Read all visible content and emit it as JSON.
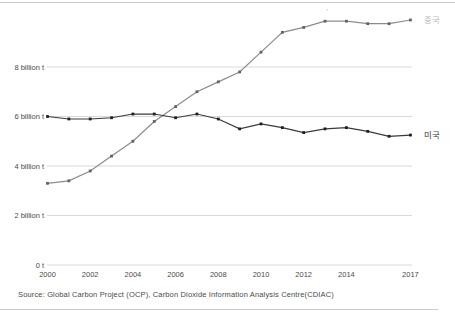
{
  "footer": {
    "source": "Source: Global Carbon Project (OCP), Carbon Dioxide Information Analysis Centre(CDIAC)"
  },
  "chart_data": {
    "type": "line",
    "x": [
      2000,
      2001,
      2002,
      2003,
      2004,
      2005,
      2006,
      2007,
      2008,
      2009,
      2010,
      2011,
      2012,
      2013,
      2014,
      2015,
      2016,
      2017
    ],
    "x_tick_labels": [
      "2000",
      "2002",
      "2004",
      "2006",
      "2008",
      "2010",
      "2012",
      "2014",
      "2017"
    ],
    "x_tick_years": [
      2000,
      2002,
      2004,
      2006,
      2008,
      2010,
      2012,
      2014,
      2017
    ],
    "y_ticks": [
      {
        "value": 0,
        "label": "0 t"
      },
      {
        "value": 2,
        "label": "2 billion t"
      },
      {
        "value": 4,
        "label": "4 billion t"
      },
      {
        "value": 6,
        "label": "6 billion t"
      },
      {
        "value": 8,
        "label": "8 billion t"
      }
    ],
    "ylim": [
      0,
      10.7
    ],
    "grid": true,
    "legend_position": "right-end-labels",
    "series": [
      {
        "name": "중국",
        "values": [
          3.3,
          3.4,
          3.8,
          4.4,
          5.0,
          5.8,
          6.4,
          7.0,
          7.4,
          7.8,
          8.6,
          9.4,
          9.6,
          9.85,
          9.85,
          9.75,
          9.75,
          9.9
        ],
        "line_color": "#8c8c8c",
        "marker_color": "#636363",
        "label_color": "#b8b8b8"
      },
      {
        "name": "미국",
        "values": [
          6.0,
          5.9,
          5.9,
          5.95,
          6.1,
          6.1,
          5.95,
          6.1,
          5.9,
          5.5,
          5.7,
          5.55,
          5.35,
          5.5,
          5.55,
          5.4,
          5.2,
          5.25
        ],
        "line_color": "#3a3a3a",
        "marker_color": "#1f1f1f",
        "label_color": "#3c3c3c"
      }
    ],
    "annotations": [
      {
        "text": "'",
        "year": 2013,
        "series": "중국"
      }
    ],
    "colors": {
      "gridline": "#d9d9d9",
      "tick_label": "#4a4a4a",
      "frame_rule": "#cccccc"
    }
  }
}
